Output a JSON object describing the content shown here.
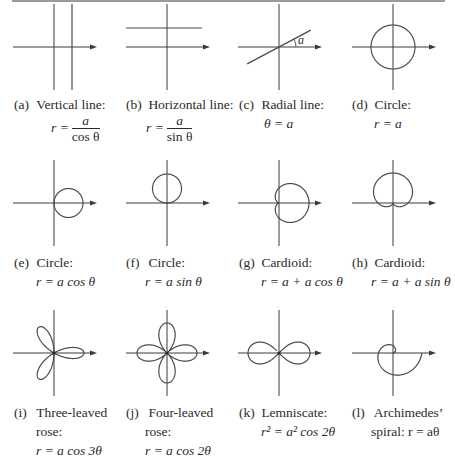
{
  "figure": {
    "colors": {
      "ink": "#2a2a2a",
      "curve": "#4a4a4a",
      "axis": "#3a3a3a",
      "rule": "#9a9a9a"
    },
    "panels": [
      {
        "id": "a",
        "label": "(a)",
        "name": "Vertical line:",
        "eq_lhs": "r =",
        "eq_num": "a",
        "eq_den": "cos θ",
        "eq": "",
        "curve": "vertical-line"
      },
      {
        "id": "b",
        "label": "(b)",
        "name": "Horizontal line:",
        "eq_lhs": "r =",
        "eq_num": "a",
        "eq_den": "sin θ",
        "eq": "",
        "curve": "horizontal-line"
      },
      {
        "id": "c",
        "label": "(c)",
        "name": "Radial line:",
        "eq": "θ = a",
        "curve": "radial-line",
        "angle_label": "a"
      },
      {
        "id": "d",
        "label": "(d)",
        "name": "Circle:",
        "eq": "r = a",
        "curve": "circle"
      },
      {
        "id": "e",
        "label": "(e)",
        "name": "Circle:",
        "eq": "r = a cos θ",
        "curve": "circle-cos"
      },
      {
        "id": "f",
        "label": "(f)",
        "name": "Circle:",
        "eq": "r = a sin θ",
        "curve": "circle-sin"
      },
      {
        "id": "g",
        "label": "(g)",
        "name": "Cardioid:",
        "eq": "r = a + a cos θ",
        "curve": "cardioid-cos"
      },
      {
        "id": "h",
        "label": "(h)",
        "name": "Cardioid:",
        "eq": "r = a + a sin θ",
        "curve": "cardioid-sin"
      },
      {
        "id": "i",
        "label": "(i)",
        "name": "Three-leaved",
        "name2": "rose:",
        "eq": "r = a cos 3θ",
        "curve": "rose-3"
      },
      {
        "id": "j",
        "label": "(j)",
        "name": "Four-leaved",
        "name2": "rose:",
        "eq": "r = a cos 2θ",
        "curve": "rose-4"
      },
      {
        "id": "k",
        "label": "(k)",
        "name": "Lemniscate:",
        "eq": "r² = a² cos 2θ",
        "curve": "lemniscate"
      },
      {
        "id": "l",
        "label": "(l)",
        "name": "Archimedes’",
        "eq": "spiral:  r = aθ",
        "curve": "spiral"
      }
    ]
  }
}
